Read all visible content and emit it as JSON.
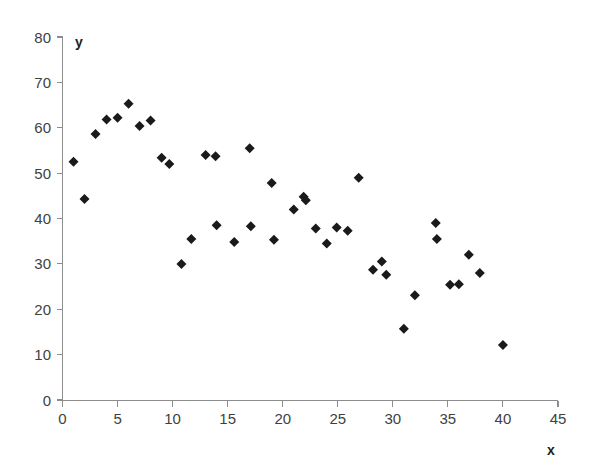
{
  "chart_data": {
    "type": "scatter",
    "title": "",
    "xlabel": "x",
    "ylabel": "y",
    "xlim": [
      0,
      45
    ],
    "ylim": [
      0,
      80
    ],
    "xticks": [
      0,
      5,
      10,
      15,
      20,
      25,
      30,
      35,
      40,
      45
    ],
    "yticks": [
      0,
      10,
      20,
      30,
      40,
      50,
      60,
      70,
      80
    ],
    "grid": false,
    "legend": null,
    "marker": "diamond",
    "marker_color": "#1a1a1a",
    "series": [
      {
        "name": "data",
        "points": [
          [
            1.0,
            52.5
          ],
          [
            2.0,
            44.3
          ],
          [
            3.0,
            58.6
          ],
          [
            4.0,
            61.8
          ],
          [
            5.0,
            62.2
          ],
          [
            6.0,
            65.3
          ],
          [
            7.0,
            60.4
          ],
          [
            8.0,
            61.6
          ],
          [
            9.0,
            53.4
          ],
          [
            9.7,
            52.0
          ],
          [
            10.8,
            30.0
          ],
          [
            11.7,
            35.5
          ],
          [
            13.0,
            54.0
          ],
          [
            13.9,
            53.7
          ],
          [
            14.0,
            38.5
          ],
          [
            15.6,
            34.8
          ],
          [
            17.0,
            55.5
          ],
          [
            17.1,
            38.3
          ],
          [
            19.0,
            47.8
          ],
          [
            19.2,
            35.3
          ],
          [
            21.0,
            42.0
          ],
          [
            21.9,
            44.8
          ],
          [
            22.1,
            44.0
          ],
          [
            23.0,
            37.8
          ],
          [
            24.0,
            34.5
          ],
          [
            24.9,
            38.0
          ],
          [
            25.9,
            37.3
          ],
          [
            26.9,
            49.0
          ],
          [
            28.2,
            28.7
          ],
          [
            29.0,
            30.5
          ],
          [
            29.4,
            27.6
          ],
          [
            31.0,
            15.7
          ],
          [
            32.0,
            23.1
          ],
          [
            33.9,
            39.0
          ],
          [
            34.0,
            35.5
          ],
          [
            35.2,
            25.4
          ],
          [
            36.0,
            25.5
          ],
          [
            36.9,
            32.0
          ],
          [
            37.9,
            28.0
          ],
          [
            40.0,
            12.1
          ]
        ]
      }
    ]
  },
  "axes": {
    "x_title": "x",
    "y_title": "y",
    "x_tick_labels": [
      "0",
      "5",
      "10",
      "15",
      "20",
      "25",
      "30",
      "35",
      "40",
      "45"
    ],
    "y_tick_labels": [
      "0",
      "10",
      "20",
      "30",
      "40",
      "50",
      "60",
      "70",
      "80"
    ]
  }
}
